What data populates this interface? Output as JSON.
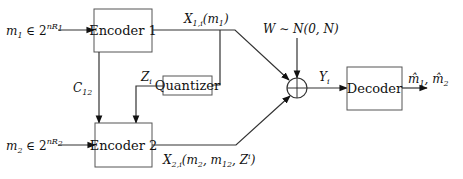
{
  "diagram": {
    "type": "block-diagram",
    "blocks": {
      "encoder1": {
        "label": "Encoder 1"
      },
      "encoder2": {
        "label": "Encoder 2"
      },
      "quantizer": {
        "label": "Quantizer"
      },
      "decoder": {
        "label": "Decoder"
      },
      "summer": {
        "label": "+"
      }
    },
    "signals": {
      "m1_input": {
        "main": "m",
        "sub": "1",
        "rest": " ∈ 2",
        "sup": "nR",
        "supsub": "1"
      },
      "m2_input": {
        "main": "m",
        "sub": "2",
        "rest": " ∈ 2",
        "sup": "nR",
        "supsub": "2"
      },
      "x1": {
        "main": "X",
        "sub": "1,i",
        "rest": "(m",
        "rest_sub": "1",
        "close": ")"
      },
      "x2": {
        "main": "X",
        "sub": "2,i",
        "rest": "(m",
        "rest_sub": "2",
        "mid": ", m",
        "mid_sub": "12",
        "tail": ", Z",
        "tail_sup": "i",
        "close": ")"
      },
      "c12": {
        "main": "C",
        "sub": "12"
      },
      "zi": {
        "main": "Z",
        "sub": "i"
      },
      "noise": {
        "text": "W ∼ N(0, N)"
      },
      "yi": {
        "main": "Y",
        "sub": "i"
      },
      "output": {
        "text1": "m̂",
        "sub1": "1",
        "sep": ", ",
        "text2": "m̂",
        "sub2": "2"
      }
    }
  }
}
